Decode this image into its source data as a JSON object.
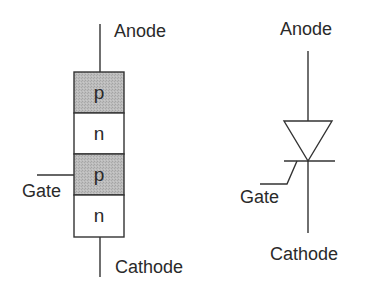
{
  "colors": {
    "line": "#333333",
    "text": "#2a2a2a",
    "p_fill": "#b8b8b8",
    "n_fill": "#ffffff",
    "background": "#ffffff"
  },
  "layer_structure": {
    "anode_label": "Anode",
    "gate_label": "Gate",
    "cathode_label": "Cathode",
    "layers": [
      {
        "label": "p",
        "doping": "p"
      },
      {
        "label": "n",
        "doping": "n"
      },
      {
        "label": "p",
        "doping": "p"
      },
      {
        "label": "n",
        "doping": "n"
      }
    ]
  },
  "circuit_symbol": {
    "anode_label": "Anode",
    "gate_label": "Gate",
    "cathode_label": "Cathode",
    "symbol": "thyristor-scr"
  }
}
